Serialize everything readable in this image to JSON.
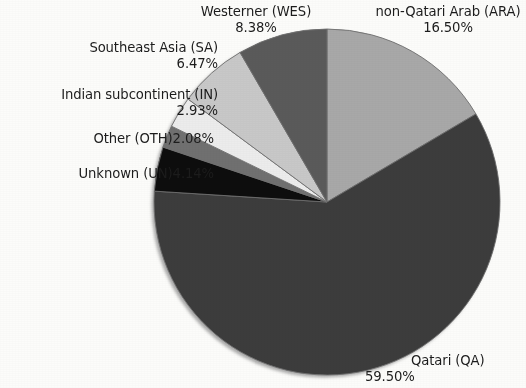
{
  "figure": {
    "background_color": "#fcfcfa",
    "text_color": "#1c1c1c"
  },
  "chart_data": {
    "type": "pie",
    "title": "",
    "subtitle": "",
    "xlabel": "",
    "ylabel": "",
    "legend_position": "none",
    "grid": false,
    "label_format": "name (code) percent",
    "start_angle_deg": 0,
    "direction": "clockwise",
    "total_percent": 100.0,
    "categories": [
      "non-Qatari Arab (ARA)",
      "Qatari (QA)",
      "Unknown (UN)",
      "Other (OTH)",
      "Indian subcontinent (IN)",
      "Southeast Asia (SA)",
      "Westerner (WES)"
    ],
    "values": [
      16.5,
      59.5,
      4.14,
      2.08,
      2.93,
      6.47,
      8.38
    ],
    "colors": [
      "#a8a8a8",
      "#3c3c3c",
      "#0d0d0d",
      "#707070",
      "#ececec",
      "#c8c8c8",
      "#5a5a5a"
    ],
    "slices": [
      {
        "key": "ara",
        "name": "non-Qatari Arab",
        "code": "ARA",
        "label": "non-Qatari Arab (ARA)",
        "percent": 16.5,
        "percent_text": "16.50%",
        "color": "#a8a8a8"
      },
      {
        "key": "qa",
        "name": "Qatari",
        "code": "QA",
        "label": "Qatari (QA)",
        "percent": 59.5,
        "percent_text": "59.50%",
        "color": "#3c3c3c"
      },
      {
        "key": "un",
        "name": "Unknown",
        "code": "UN",
        "label": "Unknown (UN)",
        "percent": 4.14,
        "percent_text": "4.14%",
        "color": "#0d0d0d"
      },
      {
        "key": "oth",
        "name": "Other",
        "code": "OTH",
        "label": "Other (OTH)",
        "percent": 2.08,
        "percent_text": "2.08%",
        "color": "#707070"
      },
      {
        "key": "in",
        "name": "Indian subcontinent",
        "code": "IN",
        "label": "Indian subcontinent (IN)",
        "percent": 2.93,
        "percent_text": "2.93%",
        "color": "#ececec"
      },
      {
        "key": "sa",
        "name": "Southeast Asia",
        "code": "SA",
        "label": "Southeast Asia (SA)",
        "percent": 6.47,
        "percent_text": "6.47%",
        "color": "#c8c8c8"
      },
      {
        "key": "wes",
        "name": "Westerner",
        "code": "WES",
        "label": "Westerner (WES)",
        "percent": 8.38,
        "percent_text": "8.38%",
        "color": "#5a5a5a"
      }
    ]
  }
}
